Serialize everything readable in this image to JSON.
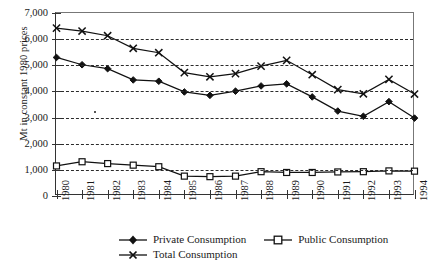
{
  "axes": {
    "ylabel": "Mt in constant 1980 prices",
    "yticks": [
      "0",
      "1,000",
      "2,000",
      "3,000",
      "4,000",
      "5,000",
      "6,000",
      "7,000"
    ],
    "xticks": [
      "1980",
      "1981",
      "1982",
      "1983",
      "1984",
      "1985",
      "1986",
      "1987",
      "1988",
      "1989",
      "1990",
      "1991",
      "1992",
      "1993",
      "1994"
    ]
  },
  "legend": {
    "items": [
      {
        "label": "Private Consumption",
        "marker": "filled-diamond",
        "color": "#111111"
      },
      {
        "label": "Public Consumption",
        "marker": "open-square",
        "color": "#111111"
      },
      {
        "label": "Total Consumption",
        "marker": "cross-star",
        "color": "#111111"
      }
    ]
  },
  "chart_data": {
    "type": "line",
    "title": "",
    "xlabel": "",
    "ylabel": "Mt in constant 1980 prices",
    "categories": [
      "1980",
      "1981",
      "1982",
      "1983",
      "1984",
      "1985",
      "1986",
      "1987",
      "1988",
      "1989",
      "1990",
      "1991",
      "1992",
      "1993",
      "1994"
    ],
    "ylim": [
      0,
      7000
    ],
    "ytick_step": 1000,
    "grid": true,
    "legend_position": "bottom-left",
    "series": [
      {
        "name": "Private Consumption",
        "marker": "filled-diamond",
        "values": [
          5300,
          5020,
          4870,
          4440,
          4390,
          3980,
          3850,
          4010,
          4210,
          4290,
          3790,
          3250,
          3050,
          3610,
          2980
        ]
      },
      {
        "name": "Public Consumption",
        "marker": "open-square",
        "values": [
          1150,
          1310,
          1240,
          1180,
          1120,
          760,
          740,
          760,
          930,
          900,
          900,
          920,
          930,
          960,
          950
        ]
      },
      {
        "name": "Total Consumption",
        "marker": "cross-star",
        "values": [
          6420,
          6310,
          6130,
          5650,
          5480,
          4720,
          4560,
          4680,
          4970,
          5190,
          4640,
          4070,
          3910,
          4460,
          3900
        ]
      }
    ]
  }
}
